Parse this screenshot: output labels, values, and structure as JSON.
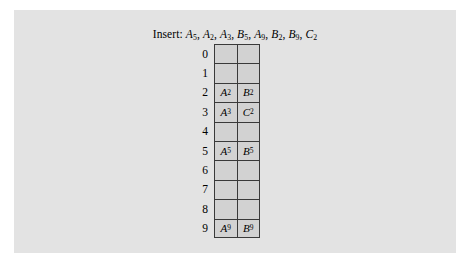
{
  "figure": {
    "caption_prefix": "Insert:",
    "insert_sequence": "A5, A2, A3, B5, A9, B2, B9, C2",
    "insert_items": [
      {
        "letter": "A",
        "sub": "5"
      },
      {
        "letter": "A",
        "sub": "2"
      },
      {
        "letter": "A",
        "sub": "3"
      },
      {
        "letter": "B",
        "sub": "5"
      },
      {
        "letter": "A",
        "sub": "9"
      },
      {
        "letter": "B",
        "sub": "2"
      },
      {
        "letter": "B",
        "sub": "9"
      },
      {
        "letter": "C",
        "sub": "2"
      }
    ],
    "panel_background": "#e3e3e3",
    "cell_background": "#d2d2d2",
    "border_color": "#3a3a3a"
  },
  "hash_table": {
    "num_rows": 10,
    "num_slots_per_row": 2,
    "row_labels": [
      "0",
      "1",
      "2",
      "3",
      "4",
      "5",
      "6",
      "7",
      "8",
      "9"
    ],
    "rows": [
      {
        "index": "0",
        "slots": [
          {
            "letter": "",
            "sub": ""
          },
          {
            "letter": "",
            "sub": ""
          }
        ]
      },
      {
        "index": "1",
        "slots": [
          {
            "letter": "",
            "sub": ""
          },
          {
            "letter": "",
            "sub": ""
          }
        ]
      },
      {
        "index": "2",
        "slots": [
          {
            "letter": "A",
            "sub": "2"
          },
          {
            "letter": "B",
            "sub": "2"
          }
        ]
      },
      {
        "index": "3",
        "slots": [
          {
            "letter": "A",
            "sub": "3"
          },
          {
            "letter": "C",
            "sub": "2"
          }
        ]
      },
      {
        "index": "4",
        "slots": [
          {
            "letter": "",
            "sub": ""
          },
          {
            "letter": "",
            "sub": ""
          }
        ]
      },
      {
        "index": "5",
        "slots": [
          {
            "letter": "A",
            "sub": "5"
          },
          {
            "letter": "B",
            "sub": "5"
          }
        ]
      },
      {
        "index": "6",
        "slots": [
          {
            "letter": "",
            "sub": ""
          },
          {
            "letter": "",
            "sub": ""
          }
        ]
      },
      {
        "index": "7",
        "slots": [
          {
            "letter": "",
            "sub": ""
          },
          {
            "letter": "",
            "sub": ""
          }
        ]
      },
      {
        "index": "8",
        "slots": [
          {
            "letter": "",
            "sub": ""
          },
          {
            "letter": "",
            "sub": ""
          }
        ]
      },
      {
        "index": "9",
        "slots": [
          {
            "letter": "A",
            "sub": "9"
          },
          {
            "letter": "B",
            "sub": "9"
          }
        ]
      }
    ]
  }
}
